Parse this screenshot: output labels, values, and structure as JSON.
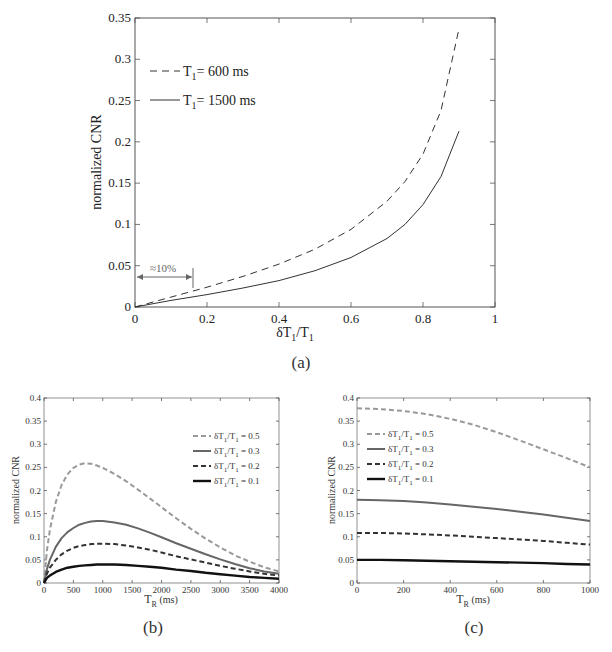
{
  "chart_data": [
    {
      "id": "a",
      "type": "line",
      "caption": "(a)",
      "title": "",
      "xlabel": "δT1/T1",
      "ylabel": "normalized CNR",
      "xlim": [
        0,
        1
      ],
      "ylim": [
        0,
        0.35
      ],
      "xticks": [
        "0",
        "0.2",
        "0.4",
        "0.6",
        "0.8",
        "1"
      ],
      "yticks": [
        "0",
        "0.05",
        "0.1",
        "0.15",
        "0.2",
        "0.25",
        "0.3",
        "0.35"
      ],
      "grid": false,
      "legend_position": "upper left",
      "annotations": [
        {
          "text": "≈10%",
          "type": "double-arrow",
          "x_range": [
            0,
            0.16
          ],
          "y": 0.036
        }
      ],
      "x": [
        0,
        0.1,
        0.2,
        0.3,
        0.4,
        0.5,
        0.6,
        0.7,
        0.75,
        0.8,
        0.85,
        0.9
      ],
      "series": [
        {
          "name": "T1= 600 ms",
          "label_main": "T",
          "label_sub": "1",
          "label_rest": "= 600 ms",
          "style": "dashed",
          "color": "#333333",
          "values": [
            0,
            0.012,
            0.024,
            0.037,
            0.052,
            0.07,
            0.094,
            0.128,
            0.152,
            0.185,
            0.238,
            0.337
          ]
        },
        {
          "name": "T1= 1500 ms",
          "label_main": "T",
          "label_sub": "1",
          "label_rest": "= 1500 ms",
          "style": "solid",
          "color": "#333333",
          "values": [
            0,
            0.008,
            0.015,
            0.023,
            0.032,
            0.044,
            0.06,
            0.083,
            0.1,
            0.124,
            0.158,
            0.213
          ]
        }
      ]
    },
    {
      "id": "b",
      "type": "line",
      "caption": "(b)",
      "title": "",
      "xlabel": "TR (ms)",
      "ylabel": "normalized CNR",
      "xlim": [
        0,
        4000
      ],
      "ylim": [
        0,
        0.4
      ],
      "xticks": [
        "0",
        "500",
        "1000",
        "1500",
        "2000",
        "2500",
        "3000",
        "3500",
        "4000"
      ],
      "yticks": [
        "0",
        "0.05",
        "0.1",
        "0.15",
        "0.2",
        "0.25",
        "0.3",
        "0.35",
        "0.4"
      ],
      "grid": false,
      "legend_position": "upper right",
      "x": [
        0,
        50,
        100,
        200,
        300,
        400,
        500,
        600,
        700,
        800,
        900,
        1000,
        1200,
        1400,
        1600,
        1800,
        2000,
        2250,
        2500,
        2750,
        3000,
        3250,
        3500,
        3750,
        4000
      ],
      "series": [
        {
          "name": "δT1/T1 = 0.5",
          "label_rest": " = 0.5",
          "style": "dashed",
          "color": "#999999",
          "width": 2,
          "values": [
            0,
            0.07,
            0.115,
            0.175,
            0.212,
            0.235,
            0.249,
            0.256,
            0.259,
            0.258,
            0.254,
            0.249,
            0.236,
            0.22,
            0.202,
            0.183,
            0.164,
            0.14,
            0.117,
            0.096,
            0.077,
            0.06,
            0.046,
            0.034,
            0.025
          ]
        },
        {
          "name": "δT1/T1 = 0.3",
          "label_rest": " = 0.3",
          "style": "solid",
          "color": "#666666",
          "width": 2,
          "values": [
            0,
            0.03,
            0.05,
            0.078,
            0.097,
            0.11,
            0.119,
            0.126,
            0.13,
            0.133,
            0.134,
            0.134,
            0.131,
            0.126,
            0.118,
            0.109,
            0.099,
            0.086,
            0.074,
            0.062,
            0.051,
            0.041,
            0.032,
            0.025,
            0.02
          ]
        },
        {
          "name": "δT1/T1 = 0.2",
          "label_rest": " = 0.2",
          "style": "dashed",
          "color": "#333333",
          "width": 2,
          "values": [
            0,
            0.02,
            0.033,
            0.05,
            0.062,
            0.07,
            0.076,
            0.08,
            0.082,
            0.084,
            0.085,
            0.085,
            0.084,
            0.081,
            0.077,
            0.072,
            0.066,
            0.058,
            0.051,
            0.044,
            0.037,
            0.031,
            0.025,
            0.02,
            0.016
          ]
        },
        {
          "name": "δT1/T1 = 0.1",
          "label_rest": " = 0.1",
          "style": "solid",
          "color": "#111111",
          "width": 2.4,
          "values": [
            0,
            0.011,
            0.016,
            0.024,
            0.029,
            0.033,
            0.035,
            0.037,
            0.038,
            0.039,
            0.04,
            0.04,
            0.04,
            0.039,
            0.037,
            0.035,
            0.033,
            0.029,
            0.026,
            0.022,
            0.019,
            0.016,
            0.013,
            0.011,
            0.009
          ]
        }
      ]
    },
    {
      "id": "c",
      "type": "line",
      "caption": "(c)",
      "title": "",
      "xlabel": "TR (ms)",
      "ylabel": "normalized CNR",
      "xlim": [
        0,
        1000
      ],
      "ylim": [
        0,
        0.4
      ],
      "xticks": [
        "0",
        "200",
        "400",
        "600",
        "800",
        "1000"
      ],
      "yticks": [
        "0",
        "0.05",
        "0.1",
        "0.15",
        "0.2",
        "0.25",
        "0.3",
        "0.35",
        "0.4"
      ],
      "grid": false,
      "legend_position": "upper left",
      "x": [
        0,
        100,
        200,
        300,
        400,
        500,
        600,
        700,
        800,
        900,
        1000
      ],
      "series": [
        {
          "name": "δT1/T1 = 0.5",
          "label_rest": " = 0.5",
          "style": "dashed",
          "color": "#999999",
          "width": 2,
          "values": [
            0.378,
            0.376,
            0.372,
            0.365,
            0.355,
            0.342,
            0.326,
            0.308,
            0.289,
            0.27,
            0.25
          ]
        },
        {
          "name": "δT1/T1 = 0.3",
          "label_rest": " = 0.3",
          "style": "solid",
          "color": "#666666",
          "width": 2,
          "values": [
            0.18,
            0.179,
            0.177,
            0.174,
            0.17,
            0.165,
            0.16,
            0.154,
            0.148,
            0.141,
            0.134
          ]
        },
        {
          "name": "δT1/T1 = 0.2",
          "label_rest": " = 0.2",
          "style": "dashed",
          "color": "#333333",
          "width": 2,
          "values": [
            0.108,
            0.108,
            0.107,
            0.105,
            0.103,
            0.1,
            0.097,
            0.094,
            0.091,
            0.087,
            0.083
          ]
        },
        {
          "name": "δT1/T1 = 0.1",
          "label_rest": " = 0.1",
          "style": "solid",
          "color": "#111111",
          "width": 2.4,
          "values": [
            0.05,
            0.05,
            0.049,
            0.048,
            0.047,
            0.046,
            0.045,
            0.044,
            0.043,
            0.041,
            0.04
          ]
        }
      ]
    }
  ],
  "figure": {
    "captions": [
      "(a)",
      "(b)",
      "(c)"
    ],
    "annotation_a": "≈10%",
    "ylabel": "normalized CNR",
    "xlabel_a_main": "δT",
    "xlabel_a_sub": "1",
    "xlabel_a_rest": "/T",
    "xlabel_a_sub2": "1",
    "xlabel_bc_main": "T",
    "xlabel_bc_sub": "R",
    "xlabel_bc_rest": " (ms)",
    "legend_prefix_main": "δT",
    "legend_prefix_sub": "1",
    "legend_prefix_mid": "/T",
    "legend_prefix_sub2": "1"
  }
}
